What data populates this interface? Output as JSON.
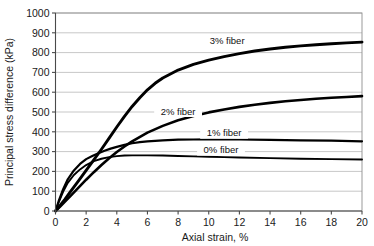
{
  "chart_data": {
    "type": "line",
    "title": "",
    "xlabel": "Axial strain, %",
    "ylabel": "Principal stress difference (kPa)",
    "xlim": [
      0,
      20
    ],
    "ylim": [
      0,
      1000
    ],
    "xticks": [
      "0",
      "2",
      "4",
      "6",
      "8",
      "10",
      "12",
      "14",
      "16",
      "18",
      "20"
    ],
    "yticks": [
      "0",
      "100",
      "200",
      "300",
      "400",
      "500",
      "600",
      "700",
      "800",
      "900",
      "1000"
    ],
    "grid": "horizontal",
    "legend_position": "inline-annotations",
    "series": [
      {
        "name": "3% fiber",
        "label": "3% fiber",
        "label_x": 11.2,
        "label_y": 855,
        "x": [
          0,
          0.3,
          0.6,
          1.0,
          1.5,
          2.0,
          2.5,
          3.0,
          3.5,
          4.0,
          4.5,
          5.0,
          5.5,
          6.0,
          6.5,
          7.0,
          8.0,
          9.0,
          10.0,
          11.0,
          12.0,
          13.0,
          14.0,
          15.0,
          16.0,
          17.0,
          18.0,
          19.0,
          20.0
        ],
        "y": [
          0,
          28,
          58,
          100,
          152,
          205,
          258,
          312,
          368,
          424,
          478,
          528,
          572,
          612,
          645,
          672,
          712,
          740,
          762,
          780,
          795,
          808,
          818,
          827,
          834,
          840,
          845,
          849,
          853
        ]
      },
      {
        "name": "2% fiber",
        "label": "2% fiber",
        "label_x": 8.0,
        "label_y": 500,
        "x": [
          0,
          0.3,
          0.6,
          1.0,
          1.5,
          2.0,
          2.5,
          3.0,
          3.5,
          4.0,
          4.5,
          5.0,
          6.0,
          7.0,
          8.0,
          9.0,
          10.0,
          11.0,
          12.0,
          13.0,
          14.0,
          15.0,
          16.0,
          17.0,
          18.0,
          19.0,
          20.0
        ],
        "y": [
          0,
          22,
          46,
          78,
          118,
          158,
          196,
          232,
          266,
          298,
          326,
          352,
          396,
          430,
          458,
          480,
          498,
          513,
          526,
          537,
          546,
          554,
          561,
          567,
          572,
          576,
          580
        ]
      },
      {
        "name": "1% fiber",
        "label": "1% fiber",
        "label_x": 11.0,
        "label_y": 390,
        "x": [
          0,
          0.2,
          0.5,
          0.8,
          1.2,
          1.6,
          2.0,
          2.4,
          2.8,
          3.2,
          3.6,
          4.0,
          4.5,
          5.0,
          5.5,
          6.0,
          7.0,
          8.0,
          9.0,
          10.0,
          12.0,
          14.0,
          16.0,
          18.0,
          20.0
        ],
        "y": [
          0,
          48,
          110,
          160,
          205,
          238,
          262,
          278,
          292,
          304,
          315,
          324,
          334,
          342,
          348,
          352,
          357,
          360,
          361,
          362,
          361,
          359,
          357,
          355,
          352
        ]
      },
      {
        "name": "0% fiber",
        "label": "0% fiber",
        "label_x": 10.8,
        "label_y": 305,
        "x": [
          0,
          0.2,
          0.5,
          0.8,
          1.2,
          1.6,
          2.0,
          2.5,
          3.0,
          3.5,
          4.0,
          4.5,
          5.0,
          6.0,
          7.0,
          8.0,
          9.0,
          10.0,
          11.0,
          12.0,
          14.0,
          16.0,
          18.0,
          20.0
        ],
        "y": [
          0,
          42,
          98,
          142,
          182,
          210,
          232,
          252,
          264,
          272,
          277,
          280,
          281,
          281,
          280,
          278,
          276,
          274,
          272,
          270,
          267,
          264,
          262,
          260
        ]
      }
    ]
  }
}
